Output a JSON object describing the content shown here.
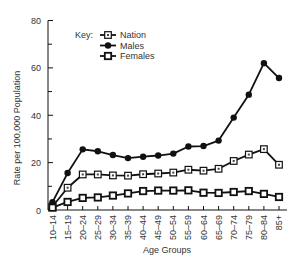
{
  "chart_data": {
    "type": "line",
    "title": "",
    "xlabel": "Age Groups",
    "ylabel": "Rate per 100,000 Population",
    "ylim": [
      0,
      80
    ],
    "yticks": [
      0,
      20,
      40,
      60,
      80
    ],
    "yminor_ticks": [
      10,
      30,
      50,
      70
    ],
    "grid": false,
    "legend_title": "Key:",
    "legend_position": "upper-left-inside",
    "categories": [
      "10–14",
      "15–19",
      "20–24",
      "25–29",
      "30–34",
      "35–39",
      "40–44",
      "45–49",
      "50–54",
      "55–59",
      "60–64",
      "65–69",
      "70–74",
      "75–79",
      "80–84",
      "85+"
    ],
    "series": [
      {
        "name": "Nation",
        "marker": "square-dot",
        "values": [
          1.5,
          9.4,
          15.0,
          15.0,
          14.6,
          14.5,
          15.1,
          15.4,
          15.8,
          17.0,
          16.6,
          17.4,
          20.7,
          23.4,
          25.7,
          19.1
        ]
      },
      {
        "name": "Males",
        "marker": "filled-circle",
        "values": [
          3.3,
          15.6,
          25.6,
          24.8,
          23.2,
          21.9,
          22.5,
          23.0,
          23.8,
          26.8,
          27.0,
          29.3,
          39.0,
          48.7,
          62.0,
          55.7
        ]
      },
      {
        "name": "Females",
        "marker": "open-square",
        "values": [
          1.0,
          3.4,
          5.1,
          5.3,
          6.1,
          7.0,
          8.0,
          8.2,
          8.2,
          8.3,
          7.3,
          7.2,
          7.6,
          8.0,
          6.8,
          5.5
        ]
      }
    ]
  }
}
